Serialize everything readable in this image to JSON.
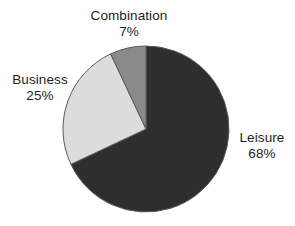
{
  "chart_data": {
    "type": "pie",
    "title": "",
    "subtitle": "",
    "xlabel": "",
    "ylabel": "",
    "grid": false,
    "legend_position": "none",
    "label_format": "name-above-percent",
    "start_angle_deg": 0,
    "direction": "clockwise",
    "total_percent": 100,
    "categories": [
      "Leisure",
      "Business",
      "Combination"
    ],
    "values": [
      68,
      25,
      7
    ],
    "units": "%",
    "slices": [
      {
        "name": "Leisure",
        "value": 68,
        "value_label": "68%",
        "color": "#2e2e2e",
        "start_angle_deg": 0,
        "end_angle_deg": 244.8,
        "label_position": "right"
      },
      {
        "name": "Business",
        "value": 25,
        "value_label": "25%",
        "color": "#dcdcdc",
        "start_angle_deg": 244.8,
        "end_angle_deg": 334.8,
        "label_position": "left"
      },
      {
        "name": "Combination",
        "value": 7,
        "value_label": "7%",
        "color": "#8a8a8a",
        "start_angle_deg": 334.8,
        "end_angle_deg": 360,
        "label_position": "top"
      }
    ]
  },
  "labels": {
    "leisure": {
      "name": "Leisure",
      "value": "68%"
    },
    "business": {
      "name": "Business",
      "value": "25%"
    },
    "combination": {
      "name": "Combination",
      "value": "7%"
    }
  },
  "colors": {
    "background": "#ffffff",
    "text": "#1c1c1c",
    "slice_leisure": "#2e2e2e",
    "slice_business": "#dcdcdc",
    "slice_combination": "#8a8a8a",
    "slice_outline": "#5a5a5a"
  },
  "geometry": {
    "center_x": 146,
    "center_y": 129,
    "radius": 83
  }
}
